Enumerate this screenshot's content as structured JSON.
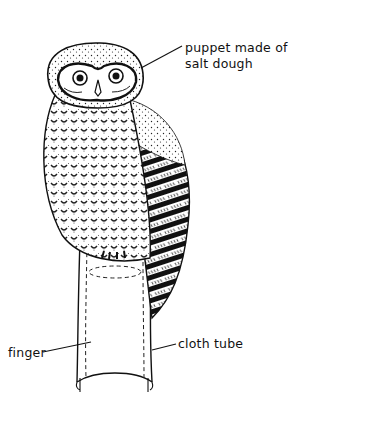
{
  "figure": {
    "labels": {
      "puppet_line1": "puppet made of",
      "puppet_line2": "salt dough",
      "finger": "finger",
      "cloth_tube": "cloth tube"
    },
    "colors": {
      "ink": "#111111",
      "background": "#ffffff"
    }
  }
}
